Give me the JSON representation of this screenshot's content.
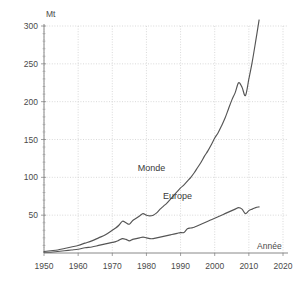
{
  "chart_data": {
    "type": "line",
    "title": "",
    "subtitle": "",
    "xlabel": "Année",
    "ylabel": "Mt",
    "xlim": [
      1947,
      2022
    ],
    "ylim": [
      0,
      315
    ],
    "grid": true,
    "legend_position": "inline-annotations",
    "x_ticks": [
      1950,
      1960,
      1970,
      1980,
      1990,
      2000,
      2010,
      2020
    ],
    "y_ticks": [
      0,
      50,
      100,
      150,
      200,
      250,
      300
    ],
    "x_tick_labels": [
      "1950",
      "1960",
      "1970",
      "1980",
      "1990",
      "2000",
      "2010",
      "2020"
    ],
    "y_tick_labels": [
      "0",
      "50",
      "100",
      "150",
      "200",
      "250",
      "300"
    ],
    "annotations": [
      {
        "text": "Monde",
        "x": 1988,
        "y": 108
      },
      {
        "text": "Europe",
        "x": 1996,
        "y": 72
      },
      {
        "text": "Mt",
        "x": 1950,
        "y": 312
      },
      {
        "text": "Année",
        "x": 2016,
        "y": 13
      }
    ],
    "series": [
      {
        "name": "Monde",
        "color": "#555555",
        "x": [
          1950,
          1952,
          1954,
          1956,
          1958,
          1960,
          1962,
          1964,
          1966,
          1968,
          1970,
          1971,
          1972,
          1973,
          1974,
          1975,
          1976,
          1977,
          1978,
          1979,
          1980,
          1981,
          1982,
          1983,
          1984,
          1985,
          1986,
          1987,
          1988,
          1989,
          1990,
          1991,
          1992,
          1993,
          1994,
          1995,
          1996,
          1997,
          1998,
          1999,
          2000,
          2001,
          2002,
          2003,
          2004,
          2005,
          2006,
          2007,
          2008,
          2009,
          2010,
          2011,
          2012,
          2013
        ],
        "values": [
          2,
          3,
          4,
          6,
          8,
          10,
          13,
          16,
          20,
          24,
          30,
          33,
          37,
          42,
          40,
          38,
          43,
          46,
          49,
          52,
          50,
          49,
          50,
          53,
          58,
          62,
          66,
          71,
          76,
          81,
          86,
          90,
          95,
          100,
          106,
          113,
          120,
          128,
          135,
          143,
          152,
          159,
          168,
          178,
          190,
          202,
          212,
          225,
          219,
          208,
          230,
          253,
          280,
          308
        ]
      },
      {
        "name": "Europe",
        "color": "#555555",
        "x": [
          1950,
          1952,
          1954,
          1956,
          1958,
          1960,
          1962,
          1964,
          1966,
          1968,
          1970,
          1971,
          1972,
          1973,
          1974,
          1975,
          1976,
          1977,
          1978,
          1979,
          1980,
          1981,
          1982,
          1983,
          1984,
          1985,
          1986,
          1987,
          1988,
          1989,
          1990,
          1991,
          1992,
          1993,
          1994,
          1995,
          1996,
          1997,
          1998,
          1999,
          2000,
          2001,
          2002,
          2003,
          2004,
          2005,
          2006,
          2007,
          2008,
          2009,
          2010,
          2011,
          2012,
          2013
        ],
        "values": [
          1,
          1,
          2,
          3,
          4,
          5,
          7,
          8,
          10,
          12,
          14,
          15,
          17,
          19,
          18,
          16,
          18,
          19,
          20,
          21,
          20,
          19,
          19,
          20,
          21,
          22,
          23,
          24,
          25,
          26,
          27,
          27,
          32,
          33,
          34,
          36,
          38,
          40,
          42,
          44,
          46,
          48,
          50,
          52,
          54,
          56,
          58,
          60,
          58,
          52,
          56,
          58,
          60,
          61
        ]
      }
    ]
  }
}
